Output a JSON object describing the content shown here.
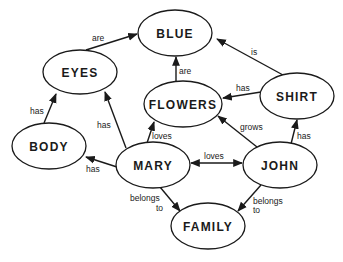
{
  "diagram": {
    "type": "concept-map",
    "nodes": [
      {
        "id": "blue",
        "label": "BLUE",
        "cx": 175,
        "cy": 33,
        "rx": 37,
        "ry": 23
      },
      {
        "id": "eyes",
        "label": "EYES",
        "cx": 80,
        "cy": 72,
        "rx": 37,
        "ry": 22
      },
      {
        "id": "flowers",
        "label": "FLOWERS",
        "cx": 183,
        "cy": 104,
        "rx": 39,
        "ry": 23
      },
      {
        "id": "shirt",
        "label": "SHIRT",
        "cx": 297,
        "cy": 96,
        "rx": 37,
        "ry": 23
      },
      {
        "id": "body",
        "label": "BODY",
        "cx": 49,
        "cy": 146,
        "rx": 37,
        "ry": 23
      },
      {
        "id": "mary",
        "label": "MARY",
        "cx": 153,
        "cy": 165,
        "rx": 37,
        "ry": 23
      },
      {
        "id": "john",
        "label": "JOHN",
        "cx": 280,
        "cy": 165,
        "rx": 37,
        "ry": 23
      },
      {
        "id": "family",
        "label": "FAMILY",
        "cx": 208,
        "cy": 226,
        "rx": 37,
        "ry": 23
      }
    ],
    "edges": [
      {
        "from": "eyes",
        "to": "blue",
        "label": "are"
      },
      {
        "from": "flowers",
        "to": "blue",
        "label": "are"
      },
      {
        "from": "shirt",
        "to": "blue",
        "label": "is"
      },
      {
        "from": "shirt",
        "to": "flowers",
        "label": "has"
      },
      {
        "from": "body",
        "to": "eyes",
        "label": "has"
      },
      {
        "from": "mary",
        "to": "eyes",
        "label": "has"
      },
      {
        "from": "mary",
        "to": "flowers",
        "label": "loves"
      },
      {
        "from": "mary",
        "to": "body",
        "label": "has"
      },
      {
        "from": "mary",
        "to": "john",
        "label": "loves",
        "bidirectional": true
      },
      {
        "from": "john",
        "to": "flowers",
        "label": "grows"
      },
      {
        "from": "john",
        "to": "shirt",
        "label": "has"
      },
      {
        "from": "mary",
        "to": "family",
        "label": "belongs to"
      },
      {
        "from": "john",
        "to": "family",
        "label": "belongs to"
      }
    ]
  },
  "labels": {
    "eyes_blue": "are",
    "flowers_blue": "are",
    "shirt_blue": "is",
    "shirt_flowers": "has",
    "body_eyes": "has",
    "mary_eyes": "has",
    "mary_flowers": "loves",
    "mary_body": "has",
    "mary_john": "loves",
    "john_flowers": "grows",
    "john_shirt": "has",
    "mary_family_1": "belongs",
    "mary_family_2": "to",
    "john_family_1": "belongs",
    "john_family_2": "to"
  },
  "node_labels": {
    "blue": "BLUE",
    "eyes": "EYES",
    "flowers": "FLOWERS",
    "shirt": "SHIRT",
    "body": "BODY",
    "mary": "MARY",
    "john": "JOHN",
    "family": "FAMILY"
  }
}
